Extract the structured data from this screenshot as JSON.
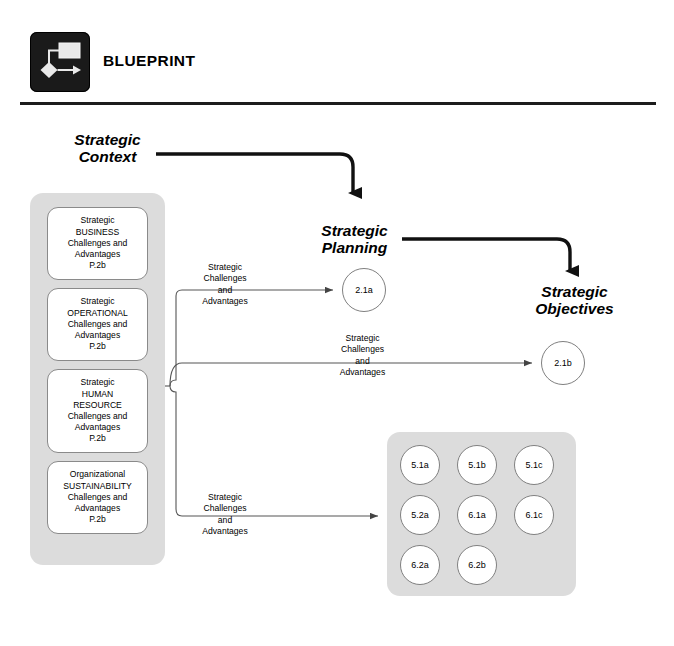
{
  "header": {
    "logo_icon": "blueprint-flowchart-icon",
    "title": "BLUEPRINT"
  },
  "sections": {
    "strategic_context": "Strategic\nContext",
    "strategic_planning": "Strategic\nPlanning",
    "strategic_objectives": "Strategic\nObjectives"
  },
  "drivers": [
    {
      "id": "business",
      "text": "Strategic\nBUSINESS\nChallenges and\nAdvantages\nP.2b"
    },
    {
      "id": "operational",
      "text": "Strategic\nOPERATIONAL\nChallenges and\nAdvantages\nP.2b"
    },
    {
      "id": "human-resource",
      "text": "Strategic\nHUMAN\nRESOURCE\nChallenges and\nAdvantages\nP.2b"
    },
    {
      "id": "sustainability",
      "text": "Organizational\nSUSTAINABILITY\nChallenges and\nAdvantages\nP.2b"
    }
  ],
  "connector_labels": {
    "to_planning": "Strategic\nChallenges\nand\nAdvantages",
    "to_objectives": "Strategic\nChallenges\nand\nAdvantages",
    "to_outcomes": "Strategic\nChallenges\nand\nAdvantages"
  },
  "process_nodes": [
    {
      "id": "2.1a",
      "label": "2.1a"
    },
    {
      "id": "2.1b",
      "label": "2.1b"
    }
  ],
  "outcome_grid": {
    "rows": [
      [
        "5.1a",
        "5.1b",
        "5.1c"
      ],
      [
        "5.2a",
        "6.1a",
        "6.1c"
      ],
      [
        "6.2a",
        "6.2b"
      ]
    ]
  },
  "colors": {
    "panel_gray": "#dcdcdc",
    "node_border": "#808080",
    "box_border": "#8a8a8a",
    "rule_dark": "#1c1c1c",
    "logo_bg": "#1a1a1a",
    "connector": "#555555",
    "bold_arrow": "#111111"
  }
}
